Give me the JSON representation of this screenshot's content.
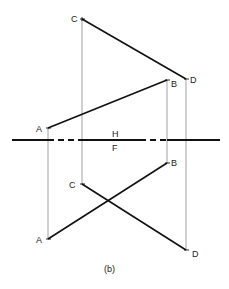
{
  "diagram": {
    "caption": "(b)",
    "fold_line": {
      "label_top": "H",
      "label_bottom": "F"
    },
    "colors": {
      "line": "#111111",
      "projector": "#888888",
      "text": "#1a1a1a"
    },
    "top_view": {
      "points": [
        {
          "label": "C",
          "x": 82,
          "y": 19
        },
        {
          "label": "D",
          "x": 186,
          "y": 79
        },
        {
          "label": "B",
          "x": 167,
          "y": 80
        },
        {
          "label": "A",
          "x": 48,
          "y": 128
        }
      ],
      "lines": [
        [
          "C",
          "D"
        ],
        [
          "A",
          "B"
        ]
      ]
    },
    "front_view": {
      "points": [
        {
          "label": "B",
          "x": 167,
          "y": 163
        },
        {
          "label": "C",
          "x": 82,
          "y": 184
        },
        {
          "label": "A",
          "x": 48,
          "y": 239
        },
        {
          "label": "D",
          "x": 186,
          "y": 250
        }
      ],
      "lines": [
        [
          "A",
          "B"
        ],
        [
          "C",
          "D"
        ]
      ]
    }
  }
}
